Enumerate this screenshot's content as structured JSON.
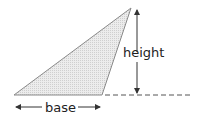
{
  "diagram": {
    "type": "triangle-base-height",
    "labels": {
      "height": "height",
      "base": "base"
    },
    "colors": {
      "fill": "#e6e6e6",
      "stroke": "#8a8a8a",
      "arrow": "#333333",
      "text": "#222222"
    }
  }
}
